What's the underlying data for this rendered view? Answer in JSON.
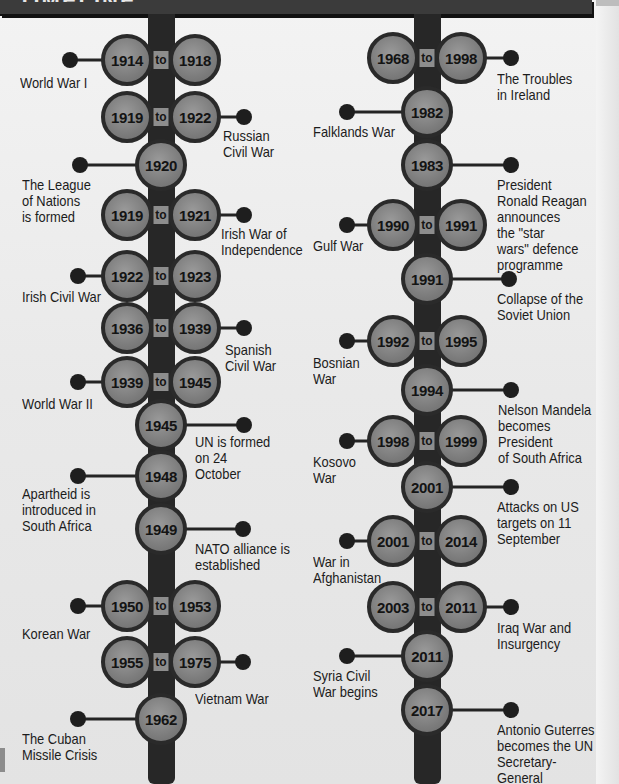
{
  "header": {
    "title": "TIMELINE",
    "color": "#3b3b3b"
  },
  "colors": {
    "spine": "#272727",
    "circle_fill": "#7c7c7c",
    "circle_border": "#2a2a2a",
    "to_box": "#8d8d8d",
    "text": "#1c1c1c",
    "background": "#ededed"
  },
  "to_label": "to",
  "columns": [
    {
      "id": "left",
      "spine_x": 161,
      "events": [
        {
          "years": [
            "1914",
            "1918"
          ],
          "y": 60,
          "side": "left",
          "dot_x": 70,
          "label": "World War I",
          "label_x": 20,
          "label_y": 75
        },
        {
          "years": [
            "1919",
            "1922"
          ],
          "y": 117,
          "side": "right",
          "dot_x": 244,
          "label": "Russian\nCivil War",
          "label_x": 223,
          "label_y": 128
        },
        {
          "years": [
            "1920"
          ],
          "y": 165,
          "side": "left",
          "dot_x": 80,
          "label": "The League\nof Nations\nis formed",
          "label_x": 22,
          "label_y": 177
        },
        {
          "years": [
            "1919",
            "1921"
          ],
          "y": 215,
          "side": "right",
          "dot_x": 244,
          "label": "Irish War of\nIndependence",
          "label_x": 221,
          "label_y": 226
        },
        {
          "years": [
            "1922",
            "1923"
          ],
          "y": 276,
          "side": "left",
          "dot_x": 78,
          "label": "Irish Civil War",
          "label_x": 22,
          "label_y": 289
        },
        {
          "years": [
            "1936",
            "1939"
          ],
          "y": 328,
          "side": "right",
          "dot_x": 244,
          "label": "Spanish\nCivil War",
          "label_x": 225,
          "label_y": 342
        },
        {
          "years": [
            "1939",
            "1945"
          ],
          "y": 382,
          "side": "left",
          "dot_x": 78,
          "label": "World War II",
          "label_x": 22,
          "label_y": 396
        },
        {
          "years": [
            "1945"
          ],
          "y": 425,
          "side": "right",
          "dot_x": 244,
          "label": "UN is formed\non 24\nOctober",
          "label_x": 195,
          "label_y": 434
        },
        {
          "years": [
            "1948"
          ],
          "y": 476,
          "side": "left",
          "dot_x": 78,
          "label": "Apartheid is\nintroduced in\nSouth Africa",
          "label_x": 22,
          "label_y": 486
        },
        {
          "years": [
            "1949"
          ],
          "y": 529,
          "side": "right",
          "dot_x": 243,
          "label": "NATO alliance is\nestablished",
          "label_x": 195,
          "label_y": 541
        },
        {
          "years": [
            "1950",
            "1953"
          ],
          "y": 606,
          "side": "left",
          "dot_x": 78,
          "label": "Korean War",
          "label_x": 22,
          "label_y": 626
        },
        {
          "years": [
            "1955",
            "1975"
          ],
          "y": 662,
          "side": "right",
          "dot_x": 243,
          "label": "Vietnam War",
          "label_x": 195,
          "label_y": 691
        },
        {
          "years": [
            "1962"
          ],
          "y": 719,
          "side": "left",
          "dot_x": 78,
          "label": "The Cuban\nMissile Crisis",
          "label_x": 22,
          "label_y": 731
        }
      ]
    },
    {
      "id": "right",
      "spine_x": 427,
      "events": [
        {
          "years": [
            "1968",
            "1998"
          ],
          "y": 58,
          "side": "right",
          "dot_x": 511,
          "label": "The Troubles\nin Ireland",
          "label_x": 497,
          "label_y": 71
        },
        {
          "years": [
            "1982"
          ],
          "y": 112,
          "side": "left",
          "dot_x": 347,
          "label": "Falklands War",
          "label_x": 313,
          "label_y": 124
        },
        {
          "years": [
            "1983"
          ],
          "y": 165,
          "side": "right",
          "dot_x": 511,
          "label": "President\nRonald Reagan\nannounces\nthe \"star\nwars\" defence\nprogramme",
          "label_x": 497,
          "label_y": 177
        },
        {
          "years": [
            "1990",
            "1991"
          ],
          "y": 225,
          "side": "left",
          "dot_x": 347,
          "label": "Gulf War",
          "label_x": 313,
          "label_y": 238
        },
        {
          "years": [
            "1991"
          ],
          "y": 279,
          "side": "right",
          "dot_x": 509,
          "label": "Collapse of the\nSoviet Union",
          "label_x": 497,
          "label_y": 291
        },
        {
          "years": [
            "1992",
            "1995"
          ],
          "y": 341,
          "side": "left",
          "dot_x": 347,
          "label": "Bosnian\nWar",
          "label_x": 313,
          "label_y": 355
        },
        {
          "years": [
            "1994"
          ],
          "y": 390,
          "side": "right",
          "dot_x": 511,
          "label": "Nelson Mandela\nbecomes President\nof South Africa",
          "label_x": 498,
          "label_y": 402
        },
        {
          "years": [
            "1998",
            "1999"
          ],
          "y": 441,
          "side": "left",
          "dot_x": 347,
          "label": "Kosovo\nWar",
          "label_x": 313,
          "label_y": 454
        },
        {
          "years": [
            "2001"
          ],
          "y": 487,
          "side": "right",
          "dot_x": 511,
          "label": "Attacks on US\ntargets on 11\nSeptember",
          "label_x": 497,
          "label_y": 499
        },
        {
          "years": [
            "2001",
            "2014"
          ],
          "y": 541,
          "side": "left",
          "dot_x": 347,
          "label": "War in\nAfghanistan",
          "label_x": 313,
          "label_y": 554
        },
        {
          "years": [
            "2003",
            "2011"
          ],
          "y": 607,
          "side": "right",
          "dot_x": 511,
          "label": "Iraq War and\nInsurgency",
          "label_x": 497,
          "label_y": 620
        },
        {
          "years": [
            "2011"
          ],
          "y": 656,
          "side": "left",
          "dot_x": 347,
          "label": "Syria Civil\nWar begins",
          "label_x": 313,
          "label_y": 668
        },
        {
          "years": [
            "2017"
          ],
          "y": 710,
          "side": "right",
          "dot_x": 511,
          "label": "Antonio Guterres\nbecomes the UN\nSecretary-General",
          "label_x": 497,
          "label_y": 722
        }
      ]
    }
  ]
}
